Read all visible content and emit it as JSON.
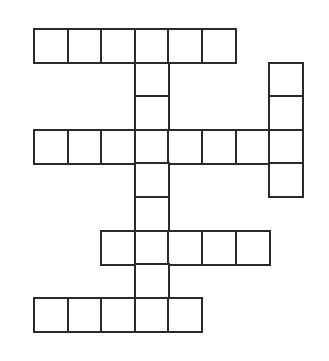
{
  "puzzle": {
    "type": "crossword",
    "grid_origin": {
      "x": 34,
      "y": 29
    },
    "cell_size": 33.6,
    "line_color": "#2a2a2a",
    "background": "#ffffff",
    "cells": [
      [
        0,
        0
      ],
      [
        1,
        0
      ],
      [
        2,
        0
      ],
      [
        3,
        0
      ],
      [
        4,
        0
      ],
      [
        5,
        0
      ],
      [
        3,
        1
      ],
      [
        7,
        1
      ],
      [
        3,
        2
      ],
      [
        7,
        2
      ],
      [
        0,
        3
      ],
      [
        1,
        3
      ],
      [
        2,
        3
      ],
      [
        3,
        3
      ],
      [
        4,
        3
      ],
      [
        5,
        3
      ],
      [
        6,
        3
      ],
      [
        7,
        3
      ],
      [
        3,
        4
      ],
      [
        7,
        4
      ],
      [
        3,
        5
      ],
      [
        2,
        6
      ],
      [
        3,
        6
      ],
      [
        4,
        6
      ],
      [
        5,
        6
      ],
      [
        6,
        6
      ],
      [
        3,
        7
      ],
      [
        0,
        8
      ],
      [
        1,
        8
      ],
      [
        2,
        8
      ],
      [
        3,
        8
      ],
      [
        4,
        8
      ]
    ],
    "entries": [
      {
        "direction": "across",
        "row": 0,
        "col": 0,
        "length": 6
      },
      {
        "direction": "across",
        "row": 3,
        "col": 0,
        "length": 8
      },
      {
        "direction": "across",
        "row": 6,
        "col": 2,
        "length": 5
      },
      {
        "direction": "across",
        "row": 8,
        "col": 0,
        "length": 5
      },
      {
        "direction": "down",
        "row": 0,
        "col": 3,
        "length": 9
      },
      {
        "direction": "down",
        "row": 1,
        "col": 7,
        "length": 4
      }
    ]
  }
}
